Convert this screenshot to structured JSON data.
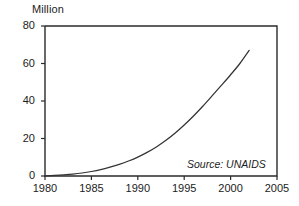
{
  "chart_data": {
    "type": "line",
    "title": "",
    "subtitle": "",
    "unit_label": "Million",
    "xlabel": "",
    "ylabel": "Million",
    "xlim": [
      1980,
      2005
    ],
    "ylim": [
      0,
      80
    ],
    "grid": false,
    "legend": "none",
    "annotations": [
      {
        "name": "source",
        "text": "Source: UNAIDS",
        "style": "italic",
        "position": "bottom-right-inside"
      }
    ],
    "x_ticks": [
      1980,
      1985,
      1990,
      1995,
      2000,
      2005
    ],
    "x_tick_labels": [
      "1980",
      "1985",
      "1990",
      "1995",
      "2000",
      "2005"
    ],
    "y_ticks": [
      0,
      20,
      40,
      60,
      80
    ],
    "y_tick_labels": [
      "0",
      "20",
      "40",
      "60",
      "80"
    ],
    "series": [
      {
        "name": "Cumulative HIV infections",
        "color": "#333333",
        "x": [
          1980,
          1981,
          1982,
          1983,
          1984,
          1985,
          1986,
          1987,
          1988,
          1989,
          1990,
          1991,
          1992,
          1993,
          1994,
          1995,
          1996,
          1997,
          1998,
          1999,
          2000,
          2001,
          2002
        ],
        "values": [
          0.1,
          0.3,
          0.6,
          1.0,
          1.6,
          2.4,
          3.4,
          4.7,
          6.2,
          8.0,
          10.1,
          12.6,
          15.5,
          18.9,
          22.8,
          27.2,
          32.0,
          37.2,
          42.7,
          48.3,
          54.0,
          60.0,
          67.0
        ]
      }
    ]
  },
  "axis_geometry": {
    "left_px": 45,
    "right_px": 277,
    "top_px": 26,
    "bottom_px": 176
  }
}
